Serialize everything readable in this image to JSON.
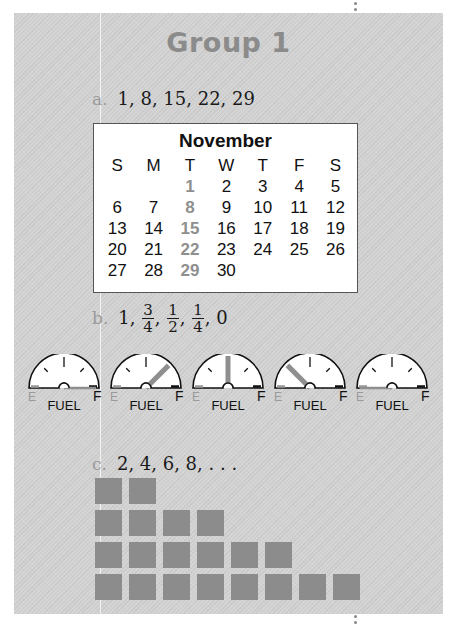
{
  "title": "Group 1",
  "items": {
    "a": {
      "label": "a.",
      "sequence": "1, 8, 15, 22, 29"
    },
    "b": {
      "label": "b.",
      "sequence_parts": {
        "first": "1,",
        "f1_num": "3",
        "f1_den": "4",
        "f2_num": "1",
        "f2_den": "2",
        "f3_num": "1",
        "f3_den": "4",
        "last": "0"
      }
    },
    "c": {
      "label": "c.",
      "sequence": "2, 4, 6, 8, . . ."
    }
  },
  "calendar": {
    "month": "November",
    "weekdays": [
      "S",
      "M",
      "T",
      "W",
      "T",
      "F",
      "S"
    ],
    "weeks": [
      [
        "",
        "",
        "1",
        "2",
        "3",
        "4",
        "5"
      ],
      [
        "6",
        "7",
        "8",
        "9",
        "10",
        "11",
        "12"
      ],
      [
        "13",
        "14",
        "15",
        "16",
        "17",
        "18",
        "19"
      ],
      [
        "20",
        "21",
        "22",
        "23",
        "24",
        "25",
        "26"
      ],
      [
        "27",
        "28",
        "29",
        "30",
        "",
        "",
        ""
      ]
    ],
    "highlight_column": 2,
    "highlight_color": "#8f8f8f"
  },
  "gauges": [
    {
      "level": "1",
      "fraction": 1.0,
      "empty_label": "E",
      "full_label": "F",
      "caption": "FUEL"
    },
    {
      "level": "3/4",
      "fraction": 0.75,
      "empty_label": "E",
      "full_label": "F",
      "caption": "FUEL"
    },
    {
      "level": "1/2",
      "fraction": 0.5,
      "empty_label": "E",
      "full_label": "F",
      "caption": "FUEL"
    },
    {
      "level": "1/4",
      "fraction": 0.25,
      "empty_label": "E",
      "full_label": "F",
      "caption": "FUEL"
    },
    {
      "level": "0",
      "fraction": 0.0,
      "empty_label": "E",
      "full_label": "F",
      "caption": "FUEL"
    }
  ],
  "block_rows": [
    2,
    4,
    6,
    8
  ],
  "colors": {
    "panel": "#d3d3d3",
    "title": "#8b8b8b",
    "block": "#8c8c8c",
    "needle": "#8f8f8f"
  }
}
